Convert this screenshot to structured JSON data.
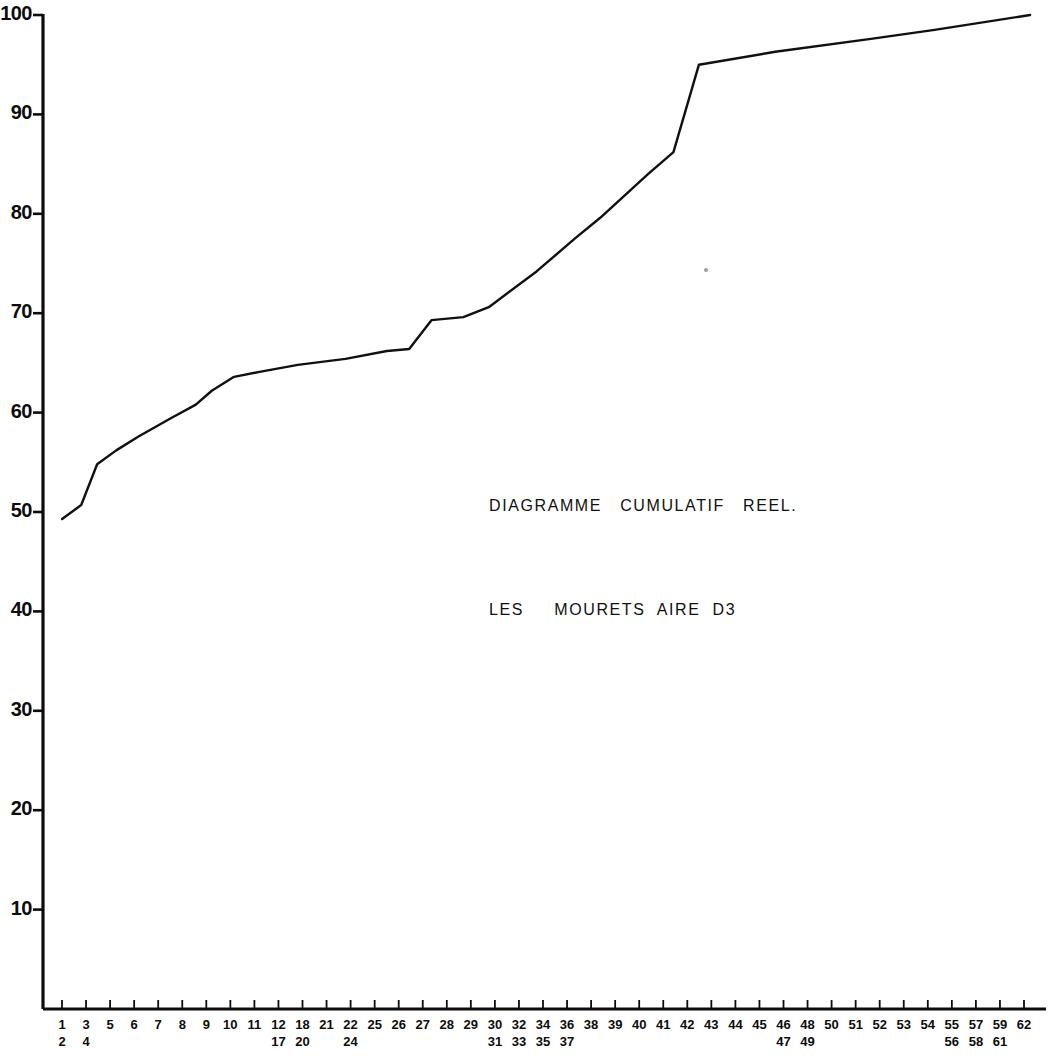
{
  "chart_data": {
    "type": "line",
    "title": "DIAGRAMME   CUMULATIF   REEL.",
    "subtitle": "LES     MOURETS  AIRE  D3",
    "xlabel": "",
    "ylabel": "",
    "xlim": [
      0,
      63
    ],
    "ylim": [
      0,
      100
    ],
    "grid": false,
    "legend": "none",
    "line_color": "#101010",
    "background_color": "#ffffff",
    "y_ticks": [
      10,
      20,
      30,
      40,
      50,
      60,
      70,
      80,
      90,
      100
    ],
    "y_tick_labels": [
      "10",
      "20",
      "30",
      "40",
      "50",
      "60",
      "70",
      "80",
      "90",
      "100"
    ],
    "x_tick_labels": [
      {
        "index": 1,
        "top": "1",
        "bottom": "2"
      },
      {
        "index": 2,
        "top": "3",
        "bottom": "4"
      },
      {
        "index": 3,
        "top": "5",
        "bottom": ""
      },
      {
        "index": 4,
        "top": "6",
        "bottom": ""
      },
      {
        "index": 5,
        "top": "7",
        "bottom": ""
      },
      {
        "index": 6,
        "top": "8",
        "bottom": ""
      },
      {
        "index": 7,
        "top": "9",
        "bottom": ""
      },
      {
        "index": 8,
        "top": "10",
        "bottom": ""
      },
      {
        "index": 9,
        "top": "11",
        "bottom": ""
      },
      {
        "index": 10,
        "top": "12",
        "bottom": "17"
      },
      {
        "index": 11,
        "top": "18",
        "bottom": "20"
      },
      {
        "index": 12,
        "top": "21",
        "bottom": ""
      },
      {
        "index": 13,
        "top": "22",
        "bottom": "24"
      },
      {
        "index": 14,
        "top": "25",
        "bottom": ""
      },
      {
        "index": 15,
        "top": "26",
        "bottom": ""
      },
      {
        "index": 16,
        "top": "27",
        "bottom": ""
      },
      {
        "index": 17,
        "top": "28",
        "bottom": ""
      },
      {
        "index": 18,
        "top": "29",
        "bottom": ""
      },
      {
        "index": 19,
        "top": "30",
        "bottom": "31"
      },
      {
        "index": 20,
        "top": "32",
        "bottom": "33"
      },
      {
        "index": 21,
        "top": "34",
        "bottom": "35"
      },
      {
        "index": 22,
        "top": "36",
        "bottom": "37"
      },
      {
        "index": 23,
        "top": "38",
        "bottom": ""
      },
      {
        "index": 24,
        "top": "39",
        "bottom": ""
      },
      {
        "index": 25,
        "top": "40",
        "bottom": ""
      },
      {
        "index": 26,
        "top": "41",
        "bottom": ""
      },
      {
        "index": 27,
        "top": "42",
        "bottom": ""
      },
      {
        "index": 28,
        "top": "43",
        "bottom": ""
      },
      {
        "index": 29,
        "top": "44",
        "bottom": ""
      },
      {
        "index": 30,
        "top": "45",
        "bottom": ""
      },
      {
        "index": 31,
        "top": "46",
        "bottom": "47"
      },
      {
        "index": 32,
        "top": "48",
        "bottom": "49"
      },
      {
        "index": 33,
        "top": "50",
        "bottom": ""
      },
      {
        "index": 34,
        "top": "51",
        "bottom": ""
      },
      {
        "index": 35,
        "top": "52",
        "bottom": ""
      },
      {
        "index": 36,
        "top": "53",
        "bottom": ""
      },
      {
        "index": 37,
        "top": "54",
        "bottom": ""
      },
      {
        "index": 38,
        "top": "55",
        "bottom": "56"
      },
      {
        "index": 39,
        "top": "57",
        "bottom": "58"
      },
      {
        "index": 40,
        "top": "59",
        "bottom": "61"
      },
      {
        "index": 41,
        "top": "62",
        "bottom": ""
      }
    ],
    "points": [
      {
        "x": 1.2,
        "y": 49.3
      },
      {
        "x": 2.4,
        "y": 50.7
      },
      {
        "x": 3.4,
        "y": 54.8
      },
      {
        "x": 4.6,
        "y": 56.2
      },
      {
        "x": 6.0,
        "y": 57.6
      },
      {
        "x": 8.0,
        "y": 59.4
      },
      {
        "x": 9.6,
        "y": 60.8
      },
      {
        "x": 10.6,
        "y": 62.2
      },
      {
        "x": 12.0,
        "y": 63.6
      },
      {
        "x": 13.6,
        "y": 64.1
      },
      {
        "x": 16.0,
        "y": 64.8
      },
      {
        "x": 19.0,
        "y": 65.4
      },
      {
        "x": 21.6,
        "y": 66.2
      },
      {
        "x": 23.0,
        "y": 66.4
      },
      {
        "x": 24.4,
        "y": 69.3
      },
      {
        "x": 26.4,
        "y": 69.6
      },
      {
        "x": 28.0,
        "y": 70.6
      },
      {
        "x": 31.0,
        "y": 74.2
      },
      {
        "x": 33.4,
        "y": 77.5
      },
      {
        "x": 35.0,
        "y": 79.6
      },
      {
        "x": 38.0,
        "y": 84.0
      },
      {
        "x": 39.6,
        "y": 86.2
      },
      {
        "x": 41.2,
        "y": 95.0
      },
      {
        "x": 46.0,
        "y": 96.3
      },
      {
        "x": 52.0,
        "y": 97.6
      },
      {
        "x": 56.0,
        "y": 98.5
      },
      {
        "x": 62.0,
        "y": 100.0
      }
    ]
  },
  "annotations": {
    "line1": "DIAGRAMME   CUMULATIF   REEL.",
    "line2": "LES     MOURETS  AIRE  D3"
  }
}
